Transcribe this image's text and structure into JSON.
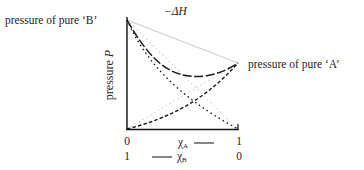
{
  "diagram": {
    "title": "−ΔH",
    "label_pure_b": "pressure of pure ‘B’",
    "label_pure_a": "pressure of pure ‘A’",
    "y_axis_label": "pressure P",
    "y_axis_label_plain": "pressure ",
    "y_axis_label_var": "P",
    "x_axis": {
      "chi_a": {
        "symbol": "χ",
        "sub": "A",
        "left_tick": "0",
        "right_tick": "1"
      },
      "chi_b": {
        "symbol": "χ",
        "sub": "B",
        "left_tick": "1",
        "right_tick": "0"
      }
    },
    "curves": [
      {
        "name": "ideal total pressure (Raoult)",
        "style": "solid light grey"
      },
      {
        "name": "ideal partial pressure B",
        "style": "dotted light grey"
      },
      {
        "name": "ideal partial pressure A",
        "style": "dotted light grey"
      },
      {
        "name": "real total pressure (negative deviation)",
        "style": "dashed black"
      },
      {
        "name": "real partial pressure B",
        "style": "dotted black"
      },
      {
        "name": "real partial pressure A",
        "style": "dashed black"
      }
    ],
    "colors": {
      "real": "#1a1a1a",
      "ideal": "#c8c8c8",
      "axis": "#111111"
    }
  }
}
